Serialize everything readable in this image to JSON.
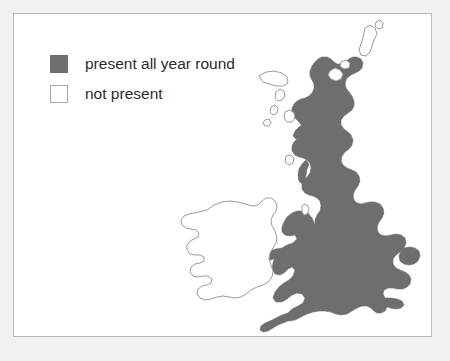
{
  "figure": {
    "name": "uk-ireland-species-distribution-map",
    "background_color": "#f1f1f1",
    "panel_color": "#ffffff",
    "panel_border_color": "#b9b9b9"
  },
  "legend": {
    "items": [
      {
        "key": "present",
        "label": "present all year round",
        "swatch_style": "filled",
        "color": "#6e6e6e",
        "border_color": "#6e6e6e"
      },
      {
        "key": "absent",
        "label": "not present",
        "swatch_style": "outlined",
        "color": "#ffffff",
        "border_color": "#a8a8a8"
      }
    ]
  },
  "map": {
    "outline_color": "#9a9a9a",
    "present_fill": "#6e6e6e",
    "absent_fill": "#ffffff",
    "regions": [
      {
        "name": "Great Britain",
        "status": "present all year round"
      },
      {
        "name": "Ireland",
        "status": "not present"
      },
      {
        "name": "Isle of Man",
        "status": "not present"
      },
      {
        "name": "Outer Hebrides",
        "status": "not present"
      },
      {
        "name": "Orkney Islands",
        "status": "not present"
      },
      {
        "name": "Shetland Islands",
        "status": "not present"
      },
      {
        "name": "Isle of Skye",
        "status": "not present"
      }
    ]
  }
}
